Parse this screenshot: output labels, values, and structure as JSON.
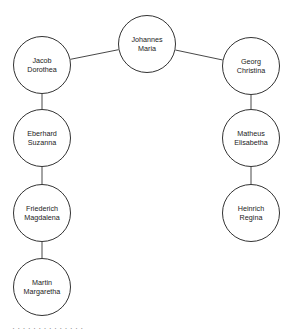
{
  "diagram": {
    "type": "family-tree",
    "nodes": [
      {
        "id": "johannes",
        "line1": "Johannes",
        "line2": "Maria",
        "cx": 147,
        "cy": 44
      },
      {
        "id": "jacob",
        "line1": "Jacob",
        "line2": "Dorothea",
        "cx": 42,
        "cy": 65
      },
      {
        "id": "georg",
        "line1": "Georg",
        "line2": "Christina",
        "cx": 251,
        "cy": 66
      },
      {
        "id": "eberhard",
        "line1": "Eberhard",
        "line2": "Suzanna",
        "cx": 42,
        "cy": 138
      },
      {
        "id": "matheus",
        "line1": "Matheus",
        "line2": "Elisabetha",
        "cx": 251,
        "cy": 138
      },
      {
        "id": "friederich",
        "line1": "Friederich",
        "line2": "Magdalena",
        "cx": 42,
        "cy": 213
      },
      {
        "id": "heinrich",
        "line1": "Heinrich",
        "line2": "Regina",
        "cx": 251,
        "cy": 213
      },
      {
        "id": "martin",
        "line1": "Martin",
        "line2": "Margaretha",
        "cx": 42,
        "cy": 287
      }
    ],
    "edges": [
      {
        "from": "johannes",
        "to": "jacob"
      },
      {
        "from": "johannes",
        "to": "georg"
      },
      {
        "from": "jacob",
        "to": "eberhard"
      },
      {
        "from": "eberhard",
        "to": "friederich"
      },
      {
        "from": "friederich",
        "to": "martin"
      },
      {
        "from": "georg",
        "to": "matheus"
      },
      {
        "from": "matheus",
        "to": "heinrich"
      }
    ],
    "radius": 29,
    "stroke_color": "#333333"
  },
  "caption": {
    "text": "· · · · · · · · · · · · · ·"
  }
}
